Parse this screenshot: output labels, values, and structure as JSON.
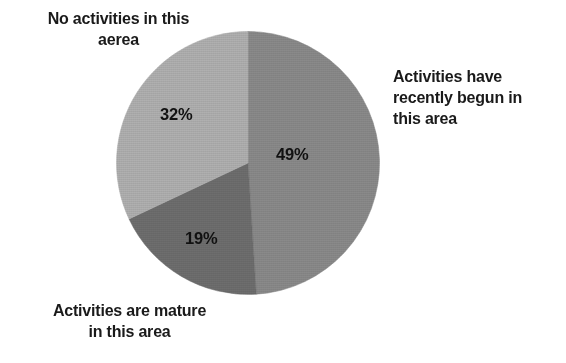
{
  "chart_data": {
    "type": "pie",
    "title": "",
    "subtitle": "",
    "xlabel": "",
    "ylabel": "",
    "grid": false,
    "legend_position": "around-slices",
    "start_angle_deg": 0,
    "direction": "clockwise",
    "categories": [
      "Activities have recently begun in this area",
      "Activities are mature in this area",
      "No activities in this aerea"
    ],
    "values": [
      49,
      19,
      32
    ],
    "value_labels": [
      "49%",
      "19%",
      "32%"
    ],
    "units": "percent",
    "total": 100,
    "colors": [
      "#8a8a8a",
      "#6e6e6e",
      "#b0b0b0"
    ],
    "slices": [
      {
        "name": "Activities have recently begun in this area",
        "value": 49,
        "value_label": "49%",
        "color": "#8a8a8a",
        "label_lines": [
          "Activities have",
          "recently begun in",
          "this area"
        ],
        "label_align": "left"
      },
      {
        "name": "Activities are mature in this area",
        "value": 19,
        "value_label": "19%",
        "color": "#6e6e6e",
        "label_lines": [
          "Activities are mature",
          "in this area"
        ],
        "label_align": "center"
      },
      {
        "name": "No activities in this aerea",
        "value": 32,
        "value_label": "32%",
        "color": "#b0b0b0",
        "label_lines": [
          "No activities in this",
          "aerea"
        ],
        "label_align": "center"
      }
    ]
  },
  "labels": {
    "none": {
      "line1": "No activities in this",
      "line2": "aerea"
    },
    "recent": {
      "line1": "Activities have",
      "line2": "recently begun in",
      "line3": "this area"
    },
    "mature": {
      "line1": "Activities are mature",
      "line2": "in this area"
    }
  },
  "values": {
    "recent": "49%",
    "mature": "19%",
    "none": "32%"
  },
  "colors": {
    "background": "#ffffff",
    "text": "#1a1a1a",
    "slice_recent": "#8a8a8a",
    "slice_mature": "#6e6e6e",
    "slice_none": "#b0b0b0",
    "slice_edge": "#9a9a9a"
  }
}
